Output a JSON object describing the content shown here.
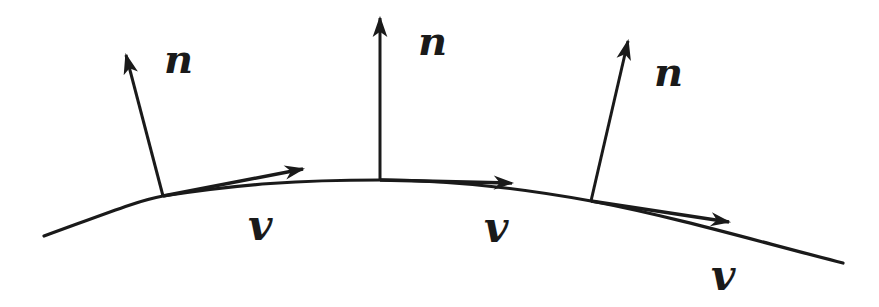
{
  "diagram": {
    "title": "",
    "stroke_color": "#1a1a1a",
    "background": "#ffffff",
    "curve": {
      "path": "M44,236 C110,212 140,200 163,196 C240,184 300,180 380,180 C450,180 520,188 591,201 C680,218 760,242 843,263"
    },
    "points": [
      {
        "id": "p1",
        "base": [
          163,
          196
        ],
        "normal_tip": [
          126,
          55
        ],
        "tangent_tip": [
          303,
          169
        ],
        "normal_label": "n",
        "normal_label_pos": [
          164,
          73
        ],
        "tangent_label": "v",
        "tangent_label_pos": [
          248,
          240
        ]
      },
      {
        "id": "p2",
        "base": [
          380,
          180
        ],
        "normal_tip": [
          380,
          18
        ],
        "tangent_tip": [
          512,
          183
        ],
        "normal_label": "n",
        "normal_label_pos": [
          418,
          55
        ],
        "tangent_label": "v",
        "tangent_label_pos": [
          484,
          242
        ]
      },
      {
        "id": "p3",
        "base": [
          591,
          201
        ],
        "normal_tip": [
          628,
          41
        ],
        "tangent_tip": [
          729,
          222
        ],
        "normal_label": "n",
        "normal_label_pos": [
          654,
          86
        ],
        "tangent_label": "v",
        "tangent_label_pos": [
          711,
          290
        ]
      }
    ]
  }
}
